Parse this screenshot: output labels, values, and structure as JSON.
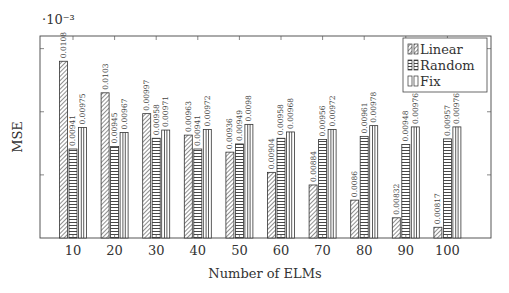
{
  "chart_data": {
    "type": "bar",
    "title": "",
    "xlabel": "Number of ELMs",
    "ylabel": "MSE",
    "y_multiplier_label": "·10⁻³",
    "categories": [
      "10",
      "20",
      "30",
      "40",
      "50",
      "60",
      "70",
      "80",
      "90",
      "100"
    ],
    "series": [
      {
        "name": "Linear",
        "pattern": "diagonal-hatch",
        "values": [
          0.0108,
          0.0103,
          0.00997,
          0.00963,
          0.00936,
          0.00904,
          0.00884,
          0.0086,
          0.00832,
          0.00817
        ],
        "labels": [
          "0.0108",
          "0.0103",
          "0.00997",
          "0.00963",
          "0.00936",
          "0.00904",
          "0.00884",
          "0.0086",
          "0.00832",
          "0.00817"
        ]
      },
      {
        "name": "Random",
        "pattern": "horizontal-lines",
        "values": [
          0.00941,
          0.00945,
          0.00958,
          0.00941,
          0.00949,
          0.00958,
          0.00956,
          0.00961,
          0.00948,
          0.00957
        ],
        "labels": [
          "0.00941",
          "0.00945",
          "0.00958",
          "0.00941",
          "0.00949",
          "0.00958",
          "0.00956",
          "0.00961",
          "0.00948",
          "0.00957"
        ]
      },
      {
        "name": "Fix",
        "pattern": "vertical-lines",
        "values": [
          0.00975,
          0.00967,
          0.00971,
          0.00972,
          0.0098,
          0.00968,
          0.00972,
          0.00978,
          0.00976,
          0.00976
        ],
        "labels": [
          "0.00975",
          "0.00967",
          "0.00971",
          "0.00972",
          "0.0098",
          "0.00968",
          "0.00972",
          "0.00978",
          "0.00976",
          "0.00976"
        ]
      }
    ],
    "ylim": [
      0.008,
      0.0112
    ],
    "yticks": [
      0.009,
      0.01,
      0.011
    ],
    "ytick_labels_shown": false,
    "grid": false,
    "legend_position": "upper right",
    "colors": {
      "stroke": "#333333",
      "background": "#ffffff"
    }
  }
}
